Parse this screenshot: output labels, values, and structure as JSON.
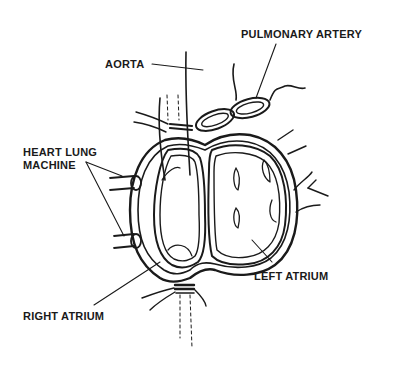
{
  "diagram": {
    "labels": {
      "pulmonary_artery": "PULMONARY ARTERY",
      "aorta": "AORTA",
      "heart_lung_line1": "HEART LUNG",
      "heart_lung_line2": "MACHINE",
      "left_atrium": "LEFT ATRIUM",
      "right_atrium": "RIGHT ATRIUM"
    },
    "colors": {
      "ink": "#1a1a1a",
      "background": "#ffffff"
    }
  }
}
